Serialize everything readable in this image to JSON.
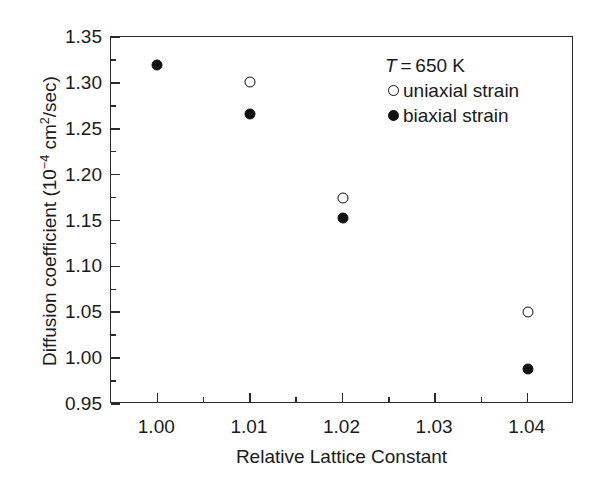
{
  "chart_data": {
    "type": "scatter",
    "title": "",
    "xlabel": "Relative Lattice Constant",
    "ylabel": "Diffusion coefficient (10⁻⁴ cm²/sec)",
    "ylabel_parts": {
      "prefix": "Diffusion coefficient (10",
      "exp": "−4",
      "mid": " cm",
      "exp2": "2",
      "suffix": "/sec)"
    },
    "xlim": [
      0.995,
      1.045
    ],
    "ylim": [
      0.95,
      1.35
    ],
    "grid": false,
    "legend_position": "top-right",
    "xticks": [
      "1.00",
      "1.01",
      "1.02",
      "1.03",
      "1.04"
    ],
    "xtick_values": [
      1.0,
      1.01,
      1.02,
      1.03,
      1.04
    ],
    "x_minor_count": 1,
    "yticks": [
      "0.95",
      "1.00",
      "1.05",
      "1.10",
      "1.15",
      "1.20",
      "1.25",
      "1.30",
      "1.35"
    ],
    "ytick_values": [
      0.95,
      1.0,
      1.05,
      1.1,
      1.15,
      1.2,
      1.25,
      1.3,
      1.35
    ],
    "y_minor_count": 1,
    "annotations": [
      {
        "text_italic": "T",
        "text_rest": " = 650 K"
      }
    ],
    "series": [
      {
        "name": "uniaxial strain",
        "marker": "open-circle",
        "color": "#111111",
        "x": [
          1.01,
          1.02,
          1.04
        ],
        "y": [
          1.301,
          1.175,
          1.05
        ]
      },
      {
        "name": "biaxial strain",
        "marker": "filled-circle",
        "color": "#111111",
        "x": [
          1.0,
          1.01,
          1.02,
          1.04
        ],
        "y": [
          1.32,
          1.266,
          1.153,
          0.988
        ]
      }
    ]
  },
  "legend": {
    "title_italic": "T",
    "title_rest": " = 650 K",
    "entries": [
      {
        "label": "uniaxial strain",
        "marker": "open-circle"
      },
      {
        "label": "biaxial strain",
        "marker": "filled-circle"
      }
    ]
  }
}
